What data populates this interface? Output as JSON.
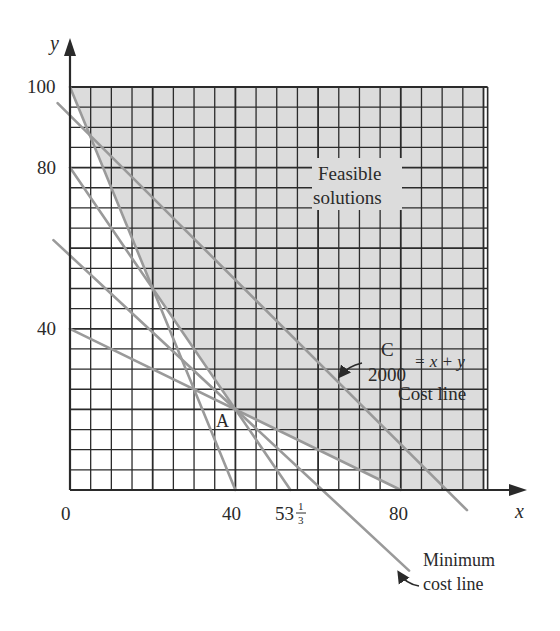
{
  "chart_data": {
    "type": "line",
    "title": "",
    "xlabel": "x",
    "ylabel": "y",
    "xlim": [
      0,
      100
    ],
    "ylim": [
      0,
      100
    ],
    "grid": true,
    "grid_step": 5,
    "x_ticks": [
      {
        "value": 0,
        "label": "0"
      },
      {
        "value": 40,
        "label": "40"
      },
      {
        "value": 53.333,
        "label": "53⅓",
        "whole": "53",
        "num": "1",
        "den": "3"
      },
      {
        "value": 80,
        "label": "80"
      }
    ],
    "y_ticks": [
      {
        "value": 100,
        "label": "100"
      },
      {
        "value": 80,
        "label": "80"
      },
      {
        "value": 40,
        "label": "40"
      }
    ],
    "series": [
      {
        "name": "constraint-1",
        "points": [
          [
            0,
            100
          ],
          [
            40,
            0
          ]
        ]
      },
      {
        "name": "constraint-2",
        "points": [
          [
            0,
            80
          ],
          [
            53.333,
            0
          ]
        ]
      },
      {
        "name": "constraint-3",
        "points": [
          [
            0,
            40
          ],
          [
            80,
            0
          ]
        ]
      },
      {
        "name": "cost-line-C",
        "equation": "C/2000 = x + y",
        "points": [
          [
            -3,
            96
          ],
          [
            96,
            -5
          ]
        ]
      },
      {
        "name": "minimum-cost-line",
        "points": [
          [
            -4,
            62
          ],
          [
            82,
            -20
          ]
        ]
      }
    ],
    "feasible_region_vertices": [
      [
        0,
        100
      ],
      [
        20,
        50
      ],
      [
        40,
        20
      ],
      [
        80,
        0
      ],
      [
        100,
        0
      ],
      [
        100,
        100
      ]
    ],
    "points": [
      {
        "name": "A",
        "x": 40,
        "y": 20
      }
    ],
    "annotations": [
      {
        "text": "Feasible solutions",
        "lines": [
          "Feasible",
          "solutions"
        ]
      },
      {
        "text": "C/2000 = x + y Cost line",
        "num": "C",
        "den": "2000",
        "rhs": "= x + y",
        "caption": "Cost line"
      },
      {
        "text": "Minimum cost line",
        "lines": [
          "Minimum",
          "cost line"
        ]
      },
      {
        "text": "A"
      }
    ]
  },
  "labels": {
    "y_axis": "y",
    "x_axis": "x",
    "y100": "100",
    "y80": "80",
    "y40": "40",
    "x0": "0",
    "x40": "40",
    "x53_whole": "53",
    "x53_num": "1",
    "x53_den": "3",
    "x80": "80",
    "point_a": "A",
    "feasible_1": "Feasible",
    "feasible_2": "solutions",
    "cost_num": "C",
    "cost_den": "2000",
    "cost_rhs": "= x + y",
    "cost_caption": "Cost line",
    "min_cost_1": "Minimum",
    "min_cost_2": "cost line"
  },
  "colors": {
    "grid": "#2b2b2b",
    "shade": "#dcdcdc",
    "lines": "#9a9a9a",
    "text": "#2a2a2a"
  }
}
